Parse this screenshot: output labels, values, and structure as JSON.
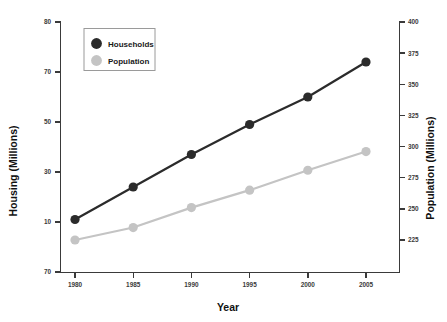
{
  "chart_data": {
    "type": "line",
    "title": "",
    "xlabel": "Year",
    "ylabel": "Housing (Millions)",
    "ylabel_right": "Population (Millions)",
    "x": [
      1980,
      1985,
      1990,
      1995,
      2000,
      2005
    ],
    "xticklabels": [
      "1980",
      "1985",
      "1990",
      "1995",
      "2000",
      "2005"
    ],
    "xlim": [
      1978.5,
      2007.5
    ],
    "grid": false,
    "legend_position": "upper-left",
    "left_axis": {
      "label": "Housing (Millions)",
      "ticklabels": [
        "80",
        "70",
        "50",
        "30",
        "10",
        "70"
      ],
      "tickvalues": [
        80,
        70,
        50,
        30,
        10,
        70
      ],
      "ylim": [
        -10,
        80
      ]
    },
    "right_axis": {
      "label": "Population (Millions)",
      "ticklabels": [
        "400",
        "375",
        "350",
        "325",
        "300",
        "275",
        "250",
        "225"
      ],
      "tickvalues": [
        400,
        375,
        350,
        325,
        300,
        275,
        250,
        225
      ],
      "ylim": [
        212,
        400
      ]
    },
    "series": [
      {
        "name": "Households",
        "axis": "left",
        "color": "#2b2b2b",
        "marker": "circle",
        "values": [
          11,
          24,
          37,
          49,
          60,
          74
        ]
      },
      {
        "name": "Population",
        "axis": "right",
        "color": "#c4c4c4",
        "marker": "circle",
        "values": [
          225,
          235,
          251,
          265,
          281,
          296
        ]
      }
    ]
  },
  "legend": {
    "items": [
      {
        "label": "Households",
        "color": "#2b2b2b"
      },
      {
        "label": "Population",
        "color": "#c4c4c4"
      }
    ]
  },
  "colors": {
    "households": "#2b2b2b",
    "population": "#c4c4c4",
    "axis": "#3a3a3a",
    "text": "#111111",
    "background": "#ffffff"
  }
}
